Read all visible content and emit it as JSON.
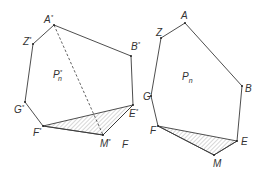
{
  "left_figure": {
    "region_label": {
      "main": "P",
      "sub": "n",
      "sup": "*"
    },
    "vertices": [
      {
        "id": "A*",
        "label": "A",
        "sup": "*",
        "x": 54,
        "y": 25
      },
      {
        "id": "B*",
        "label": "B",
        "sup": "*",
        "x": 131,
        "y": 56
      },
      {
        "id": "E*",
        "label": "E",
        "sup": "*",
        "x": 133,
        "y": 105
      },
      {
        "id": "M*",
        "label": "M",
        "sup": "*",
        "x": 103,
        "y": 135
      },
      {
        "id": "F*",
        "label": "F",
        "sup": "*",
        "x": 43,
        "y": 126
      },
      {
        "id": "G*",
        "label": "G",
        "sup": "*",
        "x": 25,
        "y": 102
      },
      {
        "id": "Z*",
        "label": "Z",
        "sup": "*",
        "x": 33,
        "y": 44
      }
    ],
    "dashed_segment": [
      "A*",
      "M*"
    ],
    "hatched_triangle": [
      "F*",
      "E*",
      "M*"
    ],
    "extra_label": "F"
  },
  "right_figure": {
    "region_label": {
      "main": "P",
      "sub": "n"
    },
    "vertices": [
      {
        "id": "A",
        "label": "A",
        "x": 185,
        "y": 23
      },
      {
        "id": "B",
        "label": "B",
        "x": 242,
        "y": 86
      },
      {
        "id": "E",
        "label": "E",
        "x": 237,
        "y": 141
      },
      {
        "id": "M",
        "label": "M",
        "x": 214,
        "y": 155
      },
      {
        "id": "F",
        "label": "F",
        "x": 158,
        "y": 126
      },
      {
        "id": "G",
        "label": "G",
        "x": 151,
        "y": 96
      },
      {
        "id": "Z",
        "label": "Z",
        "x": 161,
        "y": 38
      }
    ],
    "hatched_triangle": [
      "F",
      "E",
      "M"
    ]
  }
}
